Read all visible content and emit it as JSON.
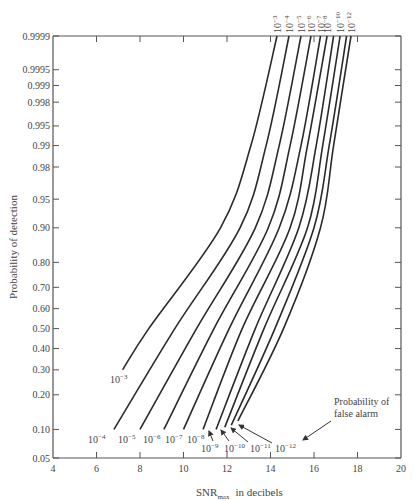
{
  "chart_data": {
    "type": "line",
    "title": "",
    "xlabel": "SNR",
    "xlabel_sub": "max",
    "xlabel_suffix": "in decibels",
    "ylabel": "Probability of detection",
    "xlim": [
      4,
      20
    ],
    "xticks": [
      4,
      6,
      8,
      10,
      12,
      14,
      16,
      18,
      20
    ],
    "y_scale": "normal-probability",
    "yticks": [
      0.05,
      0.1,
      0.2,
      0.3,
      0.4,
      0.5,
      0.6,
      0.7,
      0.8,
      0.9,
      0.95,
      0.98,
      0.99,
      0.995,
      0.998,
      0.999,
      0.9995,
      0.9999
    ],
    "ytick_labels": [
      "0.05",
      "0.10",
      "0.20",
      "0.30",
      "0.40",
      "0.50",
      "0.60",
      "0.70",
      "0.80",
      "0.90",
      "0.95",
      "0.98",
      "0.99",
      "0.995",
      "0.998",
      "0.999",
      "0.9995",
      "0.9999"
    ],
    "ylim": [
      0.05,
      0.9999
    ],
    "grid": false,
    "annotation": [
      "Probability of",
      "false alarm"
    ],
    "series": [
      {
        "name": "10^-3",
        "label": "10",
        "exp": "−3",
        "points": [
          [
            7.2,
            0.3
          ],
          [
            8.4,
            0.5
          ],
          [
            11.7,
            0.9
          ],
          [
            13.1,
            0.99
          ],
          [
            14.3,
            0.9999
          ]
        ]
      },
      {
        "name": "10^-4",
        "label": "10",
        "exp": "−4",
        "points": [
          [
            6.8,
            0.1
          ],
          [
            9.6,
            0.5
          ],
          [
            12.6,
            0.9
          ],
          [
            13.8,
            0.99
          ],
          [
            14.85,
            0.9999
          ]
        ]
      },
      {
        "name": "10^-5",
        "label": "10",
        "exp": "−5",
        "points": [
          [
            8.0,
            0.1
          ],
          [
            10.6,
            0.5
          ],
          [
            13.3,
            0.9
          ],
          [
            14.4,
            0.99
          ],
          [
            15.4,
            0.9999
          ]
        ]
      },
      {
        "name": "10^-6",
        "label": "10",
        "exp": "−6",
        "points": [
          [
            9.1,
            0.1
          ],
          [
            11.4,
            0.5
          ],
          [
            13.9,
            0.9
          ],
          [
            14.9,
            0.99
          ],
          [
            15.86,
            0.9999
          ]
        ]
      },
      {
        "name": "10^-7",
        "label": "10",
        "exp": "−7",
        "points": [
          [
            10.0,
            0.1
          ],
          [
            12.1,
            0.5
          ],
          [
            14.4,
            0.9
          ],
          [
            15.4,
            0.99
          ],
          [
            16.3,
            0.9999
          ]
        ]
      },
      {
        "name": "10^-8",
        "label": "10",
        "exp": "−8",
        "points": [
          [
            10.9,
            0.1
          ],
          [
            12.7,
            0.5
          ],
          [
            14.9,
            0.9
          ],
          [
            15.7,
            0.99
          ],
          [
            16.6,
            0.9999
          ]
        ]
      },
      {
        "name": "10^-9",
        "label": "10",
        "exp": "−9",
        "points": [
          [
            11.5,
            0.1
          ],
          [
            13.3,
            0.5
          ],
          [
            15.3,
            0.9
          ],
          [
            16.1,
            0.99
          ],
          [
            16.9,
            0.9999
          ]
        ]
      },
      {
        "name": "10^-10",
        "label": "10",
        "exp": "−10",
        "points": [
          [
            11.9,
            0.105
          ],
          [
            13.7,
            0.5
          ],
          [
            15.7,
            0.9
          ],
          [
            16.4,
            0.99
          ],
          [
            17.2,
            0.9999
          ]
        ]
      },
      {
        "name": "10^-11",
        "label": "10",
        "exp": "−11",
        "points": [
          [
            12.2,
            0.11
          ],
          [
            14.2,
            0.5
          ],
          [
            16.0,
            0.9
          ],
          [
            16.7,
            0.99
          ],
          [
            17.5,
            0.9999
          ]
        ]
      },
      {
        "name": "10^-12",
        "label": "10",
        "exp": "−12",
        "points": [
          [
            12.5,
            0.12
          ],
          [
            14.6,
            0.5
          ],
          [
            16.3,
            0.9
          ],
          [
            16.9,
            0.99
          ],
          [
            17.7,
            0.9999
          ]
        ]
      }
    ],
    "top_labels": [
      {
        "series": "10^-3",
        "exp": "−3"
      },
      {
        "series": "10^-4",
        "exp": "−4"
      },
      {
        "series": "10^-5",
        "exp": "−5"
      },
      {
        "series": "10^-6",
        "exp": "−6"
      },
      {
        "series": "10^-7",
        "exp": "−7"
      },
      {
        "series": "10^-8",
        "exp": "−8"
      },
      {
        "series": "10^-10",
        "exp": "−10"
      },
      {
        "series": "10^-12",
        "exp": "−12"
      }
    ],
    "bottom_labels": [
      {
        "exp": "−3",
        "x": 110,
        "y": 383
      },
      {
        "exp": "−4",
        "x": 88,
        "y": 443
      },
      {
        "exp": "−5",
        "x": 118,
        "y": 443
      },
      {
        "exp": "−6",
        "x": 143,
        "y": 443
      },
      {
        "exp": "−7",
        "x": 165,
        "y": 443
      },
      {
        "exp": "−8",
        "x": 187,
        "y": 443
      },
      {
        "exp": "−9",
        "x": 201,
        "y": 452
      },
      {
        "exp": "−10",
        "x": 224,
        "y": 452
      },
      {
        "exp": "−11",
        "x": 250,
        "y": 452
      },
      {
        "exp": "−12",
        "x": 275,
        "y": 452
      }
    ]
  }
}
